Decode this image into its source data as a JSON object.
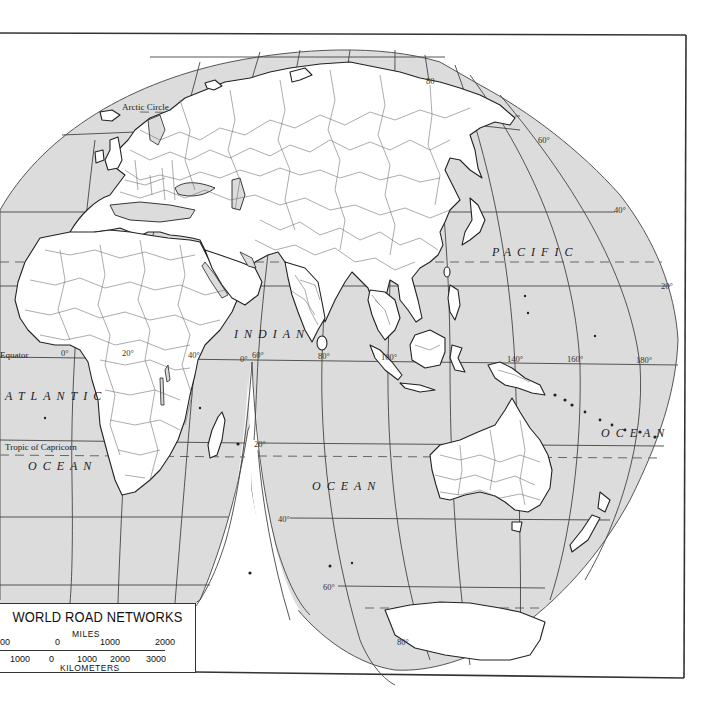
{
  "map": {
    "title": "WORLD ROAD NETWORKS",
    "projection": "interrupted-homolosine-eastern-hemisphere",
    "colors": {
      "ocean": "#dcdcdc",
      "land": "#ffffff",
      "lines": "#444444",
      "background": "#ffffff"
    },
    "ocean_labels": {
      "atlantic_1": "ATLANTIC",
      "atlantic_2": "OCEAN",
      "indian_1": "INDIAN",
      "indian_2": "OCEAN",
      "pacific_1": "PACIFIC",
      "pacific_2": "OCEAN"
    },
    "line_labels": {
      "arctic_circle": "Arctic Circle",
      "equator": "Equator",
      "tropic_capricorn": "Tropic of Capricorn"
    },
    "degree_labels": {
      "lat_80_n": "80",
      "lat_60_n": "60°",
      "lat_40_n": "40°",
      "lat_20_n": "20°",
      "lat_0": "0°",
      "lat_20_s": "20°",
      "lat_40_s": "40°",
      "lat_60_s": "60°",
      "lat_80_s": "80°",
      "lon_0": "0°",
      "lon_20": "20°",
      "lon_40": "40°",
      "lon_60": "60°",
      "lon_80": "80°",
      "lon_100": "100°",
      "lon_140": "140°",
      "lon_160": "160°",
      "lon_180": "180°"
    }
  },
  "legend": {
    "title": "WORLD ROAD NETWORKS",
    "miles_label": "MILES",
    "kilometers_label": "KILOMETERS",
    "miles_ticks": [
      "00",
      "0",
      "1000",
      "2000"
    ],
    "km_ticks": [
      "1000",
      "0",
      "1000",
      "2000",
      "3000"
    ]
  }
}
